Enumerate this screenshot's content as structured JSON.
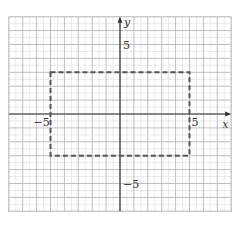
{
  "chart_data": {
    "type": "diagram",
    "title": "",
    "xlabel": "x",
    "ylabel": "y",
    "xlim": [
      -8,
      8
    ],
    "ylim": [
      -7,
      7
    ],
    "grid": true,
    "grid_major_step": 1,
    "grid_minor_step": 0.5,
    "tick_labels": {
      "x": [
        {
          "value": -5,
          "label": "−5"
        },
        {
          "value": 5,
          "label": "5"
        }
      ],
      "y": [
        {
          "value": 5,
          "label": "5"
        },
        {
          "value": -5,
          "label": "−5"
        }
      ]
    },
    "shapes": [
      {
        "type": "rectangle",
        "style": "dashed",
        "corners": [
          [
            -5,
            3
          ],
          [
            5,
            3
          ],
          [
            5,
            -3
          ],
          [
            -5,
            -3
          ]
        ],
        "width": 10,
        "height": 6
      }
    ]
  },
  "labels": {
    "x_axis": "x",
    "y_axis": "y",
    "x_neg5": "−5",
    "x_pos5": "5",
    "y_pos5": "5",
    "y_neg5": "−5"
  },
  "colors": {
    "grid_major": "#b8b8b8",
    "grid_minor": "#dcdcdc",
    "axis": "#333333",
    "rectangle": "#555555"
  }
}
